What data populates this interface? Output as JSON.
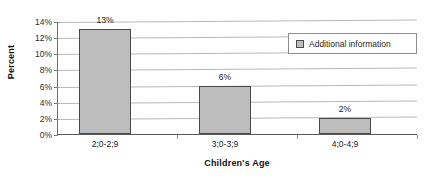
{
  "chart_data": {
    "type": "bar",
    "title": "",
    "xlabel": "Children's Age",
    "ylabel": "Percent",
    "categories": [
      "2;0-2;9",
      "3;0-3;9",
      "4;0-4;9"
    ],
    "values": [
      13,
      6,
      2
    ],
    "data_labels": [
      "13%",
      "6%",
      "2%"
    ],
    "ylim": [
      0,
      14
    ],
    "ytick_values": [
      0,
      2,
      4,
      6,
      8,
      10,
      12,
      14
    ],
    "ytick_labels": [
      "0%",
      "2%",
      "4%",
      "6%",
      "8%",
      "10%",
      "12%",
      "14%"
    ],
    "grid": true,
    "legend_position": "top-right",
    "series": [
      {
        "name": "Additional information",
        "values": [
          13,
          6,
          2
        ],
        "color": "#bdbdbd",
        "border_color": "#4a4a4a"
      }
    ]
  },
  "legend": {
    "entry_label": "Additional information"
  },
  "colors": {
    "bar_fill": "#bdbdbd",
    "bar_border": "#4a4a4a",
    "gridline": "#b9b9b9",
    "axis": "#5a5a5a",
    "background": "#ffffff",
    "text": "#1a1a1a"
  }
}
